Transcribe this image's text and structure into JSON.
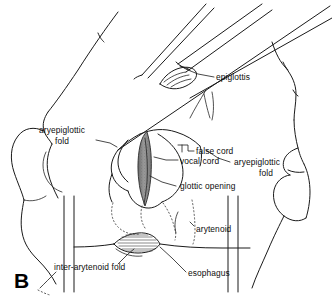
{
  "figure": {
    "panel_letter": "B",
    "background_color": "#ffffff",
    "line_color": "#1a1a1a",
    "glottis_fill_color": "#8e8e8e",
    "width": 332,
    "height": 301
  },
  "labels": {
    "epiglottis": "epiglottis",
    "aryepiglottic_fold_left_line1": "aryepiglottic",
    "aryepiglottic_fold_left_line2": "fold",
    "aryepiglottic_fold_right_line1": "aryepiglottic",
    "aryepiglottic_fold_right_line2": "fold",
    "false_cord": "false cord",
    "vocal_cord": "vocal cord",
    "glottic_opening": "glottic opening",
    "arytenoid": "arytenoid",
    "inter_arytenoid_fold": "inter-arytenoid fold",
    "esophagus": "esophagus"
  }
}
